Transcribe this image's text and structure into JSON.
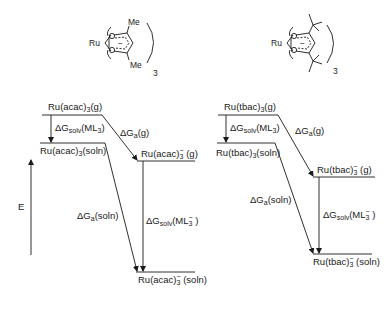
{
  "structures": {
    "left": {
      "metal": "Ru",
      "substituent_top": "Me",
      "substituent_bottom": "Me",
      "charge": "−",
      "multiplier": "3"
    },
    "right": {
      "metal": "Ru",
      "substituent_top": "tBu",
      "substituent_bottom": "tBu",
      "charge": "−",
      "multiplier": "3"
    }
  },
  "axis": {
    "label": "E"
  },
  "left_diagram": {
    "gas_neutral": {
      "base": "Ru(acac)",
      "sub": "3",
      "suffix": "(g)"
    },
    "soln_neutral": {
      "base": "Ru(acac)",
      "sub": "3",
      "suffix": "(soln)"
    },
    "gas_anion": {
      "base": "Ru(acac)",
      "sub": "3",
      "sup": "−",
      "suffix": " (g)"
    },
    "soln_anion": {
      "base": "Ru(acac)",
      "sub": "3",
      "sup": "−",
      "suffix": " (soln)"
    },
    "dG_solv_ML3": {
      "base": "ΔG",
      "sub": "solv",
      "suffix": "(ML",
      "sub2": "3",
      "end": ")"
    },
    "dG_a_g": {
      "base": "ΔG",
      "sub": "a",
      "suffix": "(g)"
    },
    "dG_a_soln": {
      "base": "ΔG",
      "sub": "a",
      "suffix": "(soln)"
    },
    "dG_solv_ML3_anion": {
      "base": "ΔG",
      "sub": "solv",
      "suffix": "(ML",
      "sub2": "3",
      "sup": "−",
      "end": " )"
    }
  },
  "right_diagram": {
    "gas_neutral": {
      "base": "Ru(tbac)",
      "sub": "3",
      "suffix": "(g)"
    },
    "soln_neutral": {
      "base": "Ru(tbac)",
      "sub": "3",
      "suffix": "(soln)"
    },
    "gas_anion": {
      "base": "Ru(tbac)",
      "sub": "3",
      "sup": "−",
      "suffix": " (g)"
    },
    "soln_anion": {
      "base": "Ru(tbac)",
      "sub": "3",
      "sup": "−",
      "suffix": " (soln)"
    },
    "dG_solv_ML3": {
      "base": "ΔG",
      "sub": "solv",
      "suffix": "(ML",
      "sub2": "3",
      "end": ")"
    },
    "dG_a_g": {
      "base": "ΔG",
      "sub": "a",
      "suffix": "(g)"
    },
    "dG_a_soln": {
      "base": "ΔG",
      "sub": "a",
      "suffix": "(soln)"
    },
    "dG_solv_ML3_anion": {
      "base": "ΔG",
      "sub": "solv",
      "suffix": "(ML",
      "sub2": "3",
      "sup": "−",
      "end": " )"
    }
  },
  "colors": {
    "ink": "#1a1a1a",
    "background": "#ffffff"
  }
}
